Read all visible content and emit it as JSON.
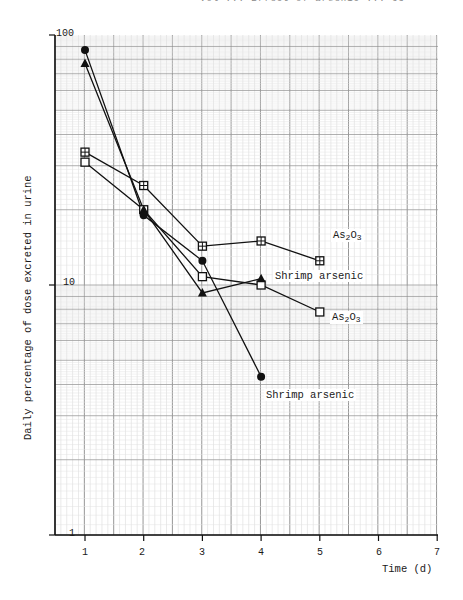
{
  "page_header": "Vol ... Effect of arsenic ... 63",
  "chart_data": {
    "type": "line",
    "title": "",
    "xlabel": "Time (d)",
    "ylabel": "Daily percentage of dose excreted in urine",
    "yscale": "log",
    "ylim": [
      1,
      100
    ],
    "xlim": [
      0.5,
      7
    ],
    "x_ticks": [
      "1",
      "2",
      "3",
      "4",
      "5",
      "6",
      "7"
    ],
    "y_ticks": [
      "1",
      "10",
      "100"
    ],
    "grid": true,
    "series": [
      {
        "name": "As2O3",
        "marker": "crossed-square",
        "x": [
          1,
          2,
          3,
          4,
          5
        ],
        "values": [
          34,
          25,
          14.3,
          15,
          12.5
        ]
      },
      {
        "name": "As2O3",
        "marker": "open-square",
        "x": [
          1,
          2,
          3,
          4,
          5
        ],
        "values": [
          31,
          20,
          10.8,
          10,
          7.8
        ]
      },
      {
        "name": "Shrimp arsenic",
        "marker": "filled-triangle",
        "x": [
          1,
          2,
          3,
          4
        ],
        "values": [
          77,
          20,
          9.3,
          10.6
        ]
      },
      {
        "name": "Shrimp arsenic",
        "marker": "filled-circle",
        "x": [
          1,
          2,
          3,
          4
        ],
        "values": [
          87,
          19,
          12.5,
          4.3
        ]
      }
    ],
    "annotations": [
      {
        "text": "As2O3",
        "x": 5.2,
        "y": 14.5
      },
      {
        "text": "Shrimp arsenic",
        "x": 4.2,
        "y": 10.6
      },
      {
        "text": "As2O3",
        "x": 5.2,
        "y": 7.2
      },
      {
        "text": "Shrimp arsenic",
        "x": 4.1,
        "y": 3.2
      }
    ]
  },
  "labels": {
    "xlabel": "Time (d)",
    "ylabel": "Daily percentage of dose excreted in urine",
    "ann1_main": "As",
    "ann1_s1": "2",
    "ann1_o": "O",
    "ann1_s2": "3",
    "ann2": "Shrimp arsenic",
    "ann3_main": "As",
    "ann3_s1": "2",
    "ann3_o": "O",
    "ann3_s2": "3",
    "ann4": "Shrimp arsenic",
    "y100": "100",
    "y10": "10",
    "y1": "1",
    "x1": "1",
    "x2": "2",
    "x3": "3",
    "x4": "4",
    "x5": "5",
    "x6": "6",
    "x7": "7"
  }
}
